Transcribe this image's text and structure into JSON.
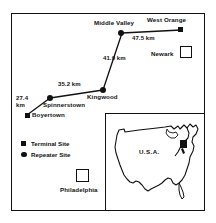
{
  "map": {
    "title": "Microwave relay route map",
    "accent_color": "#111111",
    "background_color": "#ffffff",
    "sites": [
      {
        "name": "West Orange",
        "type": "terminal",
        "marker": "filled-square",
        "x": 180,
        "y": 29,
        "label_x": 147,
        "label_y": 19
      },
      {
        "name": "Middle Valley",
        "type": "repeater",
        "marker": "filled-circle",
        "x": 120,
        "y": 32,
        "label_x": 95,
        "label_y": 22
      },
      {
        "name": "Kingwood",
        "type": "repeater",
        "marker": "filled-circle",
        "x": 101,
        "y": 89,
        "label_x": 88,
        "label_y": 94
      },
      {
        "name": "Spinnerstown",
        "type": "repeater",
        "marker": "filled-circle",
        "x": 48,
        "y": 97,
        "label_x": 44,
        "label_y": 102
      },
      {
        "name": "Boyertown",
        "type": "terminal",
        "marker": "filled-square",
        "x": 26,
        "y": 114,
        "label_x": 31,
        "label_y": 111
      }
    ],
    "links": [
      {
        "from": "Boyertown",
        "to": "Spinnerstown",
        "distance": "27.4",
        "unit": "km",
        "label": "27.4 km",
        "label_x": 17,
        "label_y": 98
      },
      {
        "from": "Spinnerstown",
        "to": "Kingwood",
        "distance": "35.2",
        "unit": "km",
        "label": "35.2 km",
        "label_x": 59,
        "label_y": 83
      },
      {
        "from": "Kingwood",
        "to": "Middle Valley",
        "distance": "41.9",
        "unit": "km",
        "label": "41.9 km",
        "label_x": 104,
        "label_y": 57
      },
      {
        "from": "Middle Valley",
        "to": "West Orange",
        "distance": "47.5",
        "unit": "km",
        "label": "47.5 km",
        "label_x": 133,
        "label_y": 36
      }
    ],
    "reference_cities": [
      {
        "name": "Newark",
        "label_x": 152,
        "label_y": 52,
        "box_x": 180,
        "box_y": 47,
        "box_size": 12
      },
      {
        "name": "Philadelphia",
        "label_x": 63,
        "label_y": 188,
        "box_x": 76,
        "box_y": 170,
        "box_size": 13
      }
    ],
    "legend": {
      "items": [
        {
          "label": "Terminal Site",
          "marker": "filled-square"
        },
        {
          "label": "Repeater Site",
          "marker": "filled-circle"
        }
      ]
    },
    "inset": {
      "label": "U.S.A.",
      "label_x": 140,
      "label_y": 150,
      "highlight_region": "New Jersey / eastern Pennsylvania"
    }
  }
}
